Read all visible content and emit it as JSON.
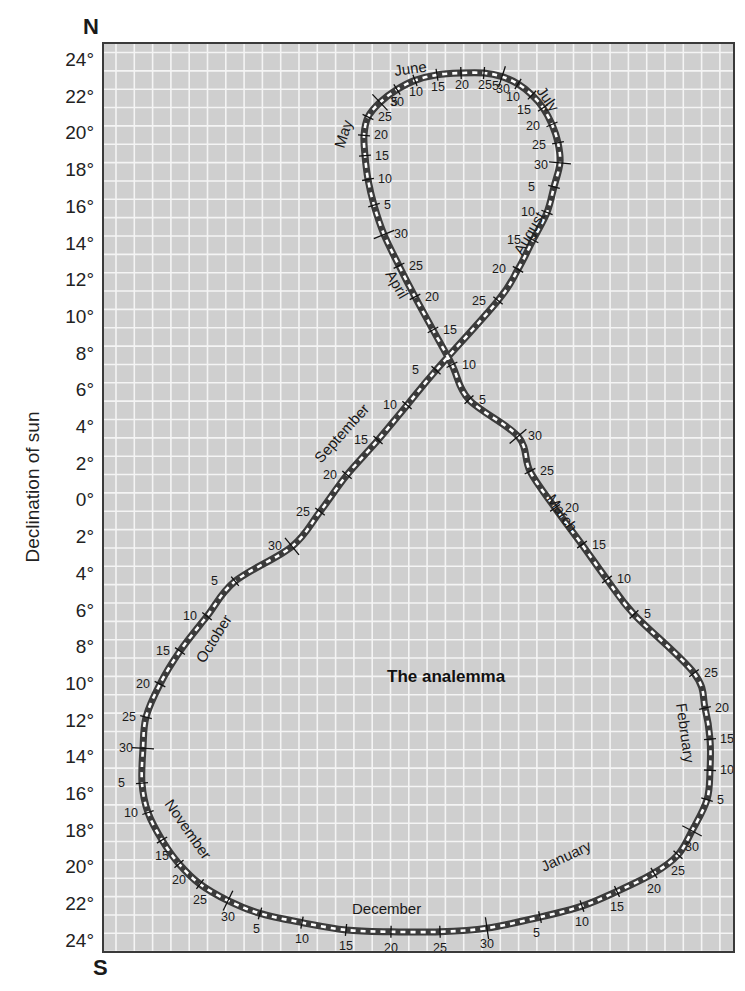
{
  "chart_data": {
    "type": "line",
    "title": "The analemma",
    "xlabel": "",
    "ylabel": "Declination of sun",
    "top_label": "N",
    "bottom_label": "S",
    "ylim": [
      -24,
      24
    ],
    "y_ticks": [
      "24°",
      "22°",
      "20°",
      "18°",
      "16°",
      "14°",
      "12°",
      "10°",
      "8°",
      "6°",
      "4°",
      "2°",
      "0°",
      "2°",
      "4°",
      "6°",
      "8°",
      "10°",
      "12°",
      "14°",
      "16°",
      "18°",
      "20°",
      "22°",
      "24°"
    ],
    "grid": true,
    "legend": null,
    "series": [
      {
        "name": "January",
        "points": [
          {
            "day": 5,
            "dec": -22.6
          },
          {
            "day": 10,
            "dec": -22.0
          },
          {
            "day": 15,
            "dec": -21.2
          },
          {
            "day": 20,
            "dec": -20.2
          },
          {
            "day": 25,
            "dec": -19.2
          },
          {
            "day": 30,
            "dec": -17.9
          }
        ]
      },
      {
        "name": "February",
        "points": [
          {
            "day": 5,
            "dec": -16.2
          },
          {
            "day": 10,
            "dec": -14.6
          },
          {
            "day": 15,
            "dec": -12.9
          },
          {
            "day": 20,
            "dec": -11.2
          },
          {
            "day": 25,
            "dec": -9.3
          }
        ]
      },
      {
        "name": "March",
        "points": [
          {
            "day": 5,
            "dec": -6.1
          },
          {
            "day": 10,
            "dec": -4.2
          },
          {
            "day": 15,
            "dec": -2.3
          },
          {
            "day": 20,
            "dec": -0.3
          },
          {
            "day": 25,
            "dec": 1.7
          },
          {
            "day": 30,
            "dec": 3.6
          }
        ]
      },
      {
        "name": "April",
        "points": [
          {
            "day": 5,
            "dec": 5.6
          },
          {
            "day": 10,
            "dec": 7.5
          },
          {
            "day": 15,
            "dec": 9.4
          },
          {
            "day": 20,
            "dec": 11.2
          },
          {
            "day": 25,
            "dec": 12.9
          },
          {
            "day": 30,
            "dec": 14.6
          }
        ]
      },
      {
        "name": "May",
        "points": [
          {
            "day": 5,
            "dec": 16.2
          },
          {
            "day": 10,
            "dec": 17.6
          },
          {
            "day": 15,
            "dec": 18.9
          },
          {
            "day": 20,
            "dec": 20.0
          },
          {
            "day": 25,
            "dec": 21.0
          },
          {
            "day": 30,
            "dec": 21.8
          }
        ]
      },
      {
        "name": "June",
        "points": [
          {
            "day": 5,
            "dec": 22.5
          },
          {
            "day": 10,
            "dec": 23.0
          },
          {
            "day": 15,
            "dec": 23.3
          },
          {
            "day": 20,
            "dec": 23.4
          },
          {
            "day": 25,
            "dec": 23.4
          },
          {
            "day": 30,
            "dec": 23.2
          }
        ]
      },
      {
        "name": "July",
        "points": [
          {
            "day": 5,
            "dec": 22.8
          },
          {
            "day": 10,
            "dec": 22.2
          },
          {
            "day": 15,
            "dec": 21.5
          },
          {
            "day": 20,
            "dec": 20.6
          },
          {
            "day": 25,
            "dec": 19.6
          },
          {
            "day": 30,
            "dec": 18.5
          }
        ]
      },
      {
        "name": "August",
        "points": [
          {
            "day": 5,
            "dec": 17.2
          },
          {
            "day": 10,
            "dec": 15.8
          },
          {
            "day": 15,
            "dec": 14.3
          },
          {
            "day": 20,
            "dec": 12.7
          },
          {
            "day": 25,
            "dec": 11.0
          }
        ]
      },
      {
        "name": "September",
        "points": [
          {
            "day": 5,
            "dec": 7.2
          },
          {
            "day": 10,
            "dec": 5.3
          },
          {
            "day": 15,
            "dec": 3.4
          },
          {
            "day": 20,
            "dec": 1.5
          },
          {
            "day": 25,
            "dec": -0.5
          },
          {
            "day": 30,
            "dec": -2.4
          }
        ]
      },
      {
        "name": "October",
        "points": [
          {
            "day": 5,
            "dec": -4.3
          },
          {
            "day": 10,
            "dec": -6.2
          },
          {
            "day": 15,
            "dec": -8.1
          },
          {
            "day": 20,
            "dec": -9.9
          },
          {
            "day": 25,
            "dec": -11.7
          },
          {
            "day": 30,
            "dec": -13.4
          }
        ]
      },
      {
        "name": "November",
        "points": [
          {
            "day": 5,
            "dec": -15.3
          },
          {
            "day": 10,
            "dec": -16.9
          },
          {
            "day": 15,
            "dec": -18.4
          },
          {
            "day": 20,
            "dec": -19.7
          },
          {
            "day": 25,
            "dec": -20.8
          },
          {
            "day": 30,
            "dec": -21.7
          }
        ]
      },
      {
        "name": "December",
        "points": [
          {
            "day": 5,
            "dec": -22.4
          },
          {
            "day": 10,
            "dec": -22.9
          },
          {
            "day": 15,
            "dec": -23.3
          },
          {
            "day": 20,
            "dec": -23.4
          },
          {
            "day": 25,
            "dec": -23.4
          },
          {
            "day": 30,
            "dec": -23.2
          }
        ]
      }
    ],
    "annotations": [
      "May",
      "June",
      "July",
      "August",
      "April",
      "September",
      "March",
      "October",
      "February",
      "November",
      "December",
      "January"
    ]
  }
}
